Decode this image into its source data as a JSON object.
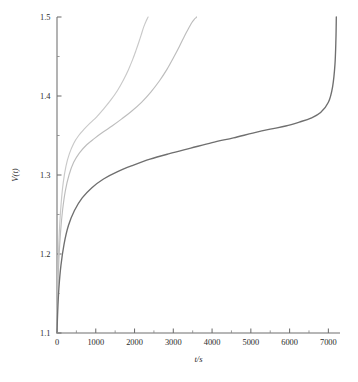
{
  "chart_data": {
    "type": "line",
    "title": "",
    "subtitle": "",
    "xlabel": "t/s",
    "ylabel": "V(t)",
    "xlim": [
      0,
      7300
    ],
    "ylim": [
      1.1,
      1.5
    ],
    "grid": false,
    "legend": "none",
    "x_ticks": [
      0,
      1000,
      2000,
      3000,
      4000,
      5000,
      6000,
      7000
    ],
    "x_tick_labels": [
      "0",
      "1000",
      "2000",
      "3000",
      "4000",
      "5000",
      "6000",
      "7000"
    ],
    "x_minor_ticks": [
      500,
      1500,
      2500,
      3500,
      4500,
      5500,
      6500
    ],
    "y_ticks": [
      1.1,
      1.2,
      1.3,
      1.4,
      1.5
    ],
    "y_tick_labels": [
      "1.1",
      "1.2",
      "1.3",
      "1.4",
      "1.5"
    ],
    "y_minor_ticks": [
      1.15,
      1.25,
      1.35,
      1.45
    ],
    "axis_color": "#6e6e6e",
    "background_color": "#ffffff",
    "series": [
      {
        "name": "curve-1",
        "color": "#c9c9c9",
        "width": 1.15,
        "x": [
          0,
          8,
          20,
          40,
          70,
          110,
          160,
          230,
          320,
          430,
          560,
          700,
          860,
          1030,
          1210,
          1390,
          1560,
          1710,
          1840,
          1950,
          2040,
          2110,
          2170,
          2220,
          2265,
          2300,
          2330,
          2350
        ],
        "y": [
          1.1,
          1.135,
          1.168,
          1.203,
          1.237,
          1.266,
          1.29,
          1.311,
          1.327,
          1.34,
          1.35,
          1.358,
          1.366,
          1.374,
          1.384,
          1.395,
          1.407,
          1.42,
          1.433,
          1.446,
          1.458,
          1.468,
          1.477,
          1.485,
          1.491,
          1.495,
          1.498,
          1.5
        ]
      },
      {
        "name": "curve-2",
        "color": "#bdbdbd",
        "width": 1.15,
        "x": [
          0,
          10,
          26,
          52,
          92,
          145,
          215,
          310,
          430,
          580,
          760,
          960,
          1180,
          1420,
          1670,
          1930,
          2180,
          2420,
          2640,
          2840,
          3010,
          3160,
          3290,
          3400,
          3480,
          3540,
          3580,
          3600
        ],
        "y": [
          1.1,
          1.132,
          1.163,
          1.196,
          1.228,
          1.256,
          1.28,
          1.3,
          1.316,
          1.328,
          1.338,
          1.346,
          1.354,
          1.362,
          1.371,
          1.381,
          1.392,
          1.405,
          1.419,
          1.434,
          1.449,
          1.463,
          1.476,
          1.486,
          1.493,
          1.497,
          1.499,
          1.5
        ]
      },
      {
        "name": "curve-3",
        "color": "#6f6f6f",
        "width": 1.35,
        "x": [
          0,
          18,
          48,
          100,
          180,
          295,
          450,
          650,
          900,
          1200,
          1550,
          1950,
          2400,
          2900,
          3450,
          4000,
          4550,
          5050,
          5500,
          5900,
          6250,
          6550,
          6800,
          7000,
          7110,
          7170,
          7195,
          7205
        ],
        "y": [
          1.1,
          1.127,
          1.156,
          1.185,
          1.212,
          1.236,
          1.255,
          1.271,
          1.284,
          1.295,
          1.304,
          1.312,
          1.32,
          1.327,
          1.334,
          1.341,
          1.347,
          1.353,
          1.358,
          1.362,
          1.367,
          1.372,
          1.379,
          1.392,
          1.412,
          1.44,
          1.472,
          1.5
        ]
      }
    ]
  },
  "figure": {
    "ylabel_text": "V(t)",
    "xlabel_text": "t/s"
  }
}
